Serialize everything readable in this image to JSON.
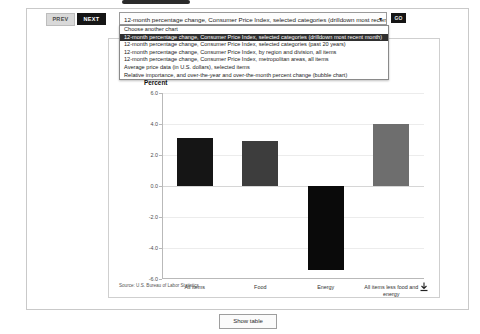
{
  "toolbar": {
    "prev_label": "PREV",
    "next_label": "NEXT",
    "go_label": "GO",
    "selected_chart": "12-month percentage change, Consumer Price Index, selected categories (drilldown most recent month)",
    "caret_icon": "chevron-down-icon"
  },
  "dropdown": {
    "options": [
      "Choose another chart",
      "12-month percentage change, Consumer Price Index, selected categories (drilldown most recent month)",
      "12-month percentage change, Consumer Price Index, selected categories (past 20 years)",
      "12-month percentage change, Consumer Price Index, by region and division, all items",
      "12-month percentage change, Consumer Price Index, metropolitan areas, all items",
      "Average price data (in U.S. dollars), selected items",
      "Relative importance, and over-the-year and over-the-month percent change (bubble chart)"
    ],
    "selected_index": 1
  },
  "card": {
    "title_visible_fragment": "mber 2023, not",
    "subtitle_visible_fragment": "major categories",
    "source": "Source: U.S. Bureau of Labor Statistics",
    "download_icon": "download-icon"
  },
  "footer": {
    "show_table_label": "Show table"
  },
  "chart_data": {
    "type": "bar",
    "title": "mber 2023, not",
    "xlabel": "",
    "ylabel": "Percent",
    "ylim": [
      -6.0,
      6.0
    ],
    "yticks": [
      "6.0",
      "4.0",
      "2.0",
      "0.0",
      "-2.0",
      "-4.0",
      "-6.0"
    ],
    "ytick_values": [
      6.0,
      4.0,
      2.0,
      0.0,
      -2.0,
      -4.0,
      -6.0
    ],
    "grid": true,
    "legend": "none",
    "categories": [
      "All items",
      "Food",
      "Energy",
      "All items less food and energy"
    ],
    "values": [
      3.1,
      2.9,
      -5.4,
      4.0
    ],
    "bar_colors": [
      "#151515",
      "#3d3d3d",
      "#0a0a0a",
      "#6e6e6e"
    ]
  }
}
